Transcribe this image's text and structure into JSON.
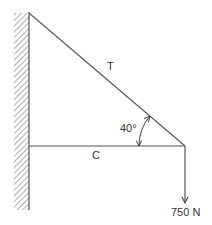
{
  "diagram": {
    "labels": {
      "tension": "T",
      "compression": "C",
      "angle": "40°",
      "load": "750 N"
    },
    "colors": {
      "line": "#555555",
      "text": "#333333",
      "hatch": "#777777"
    }
  }
}
